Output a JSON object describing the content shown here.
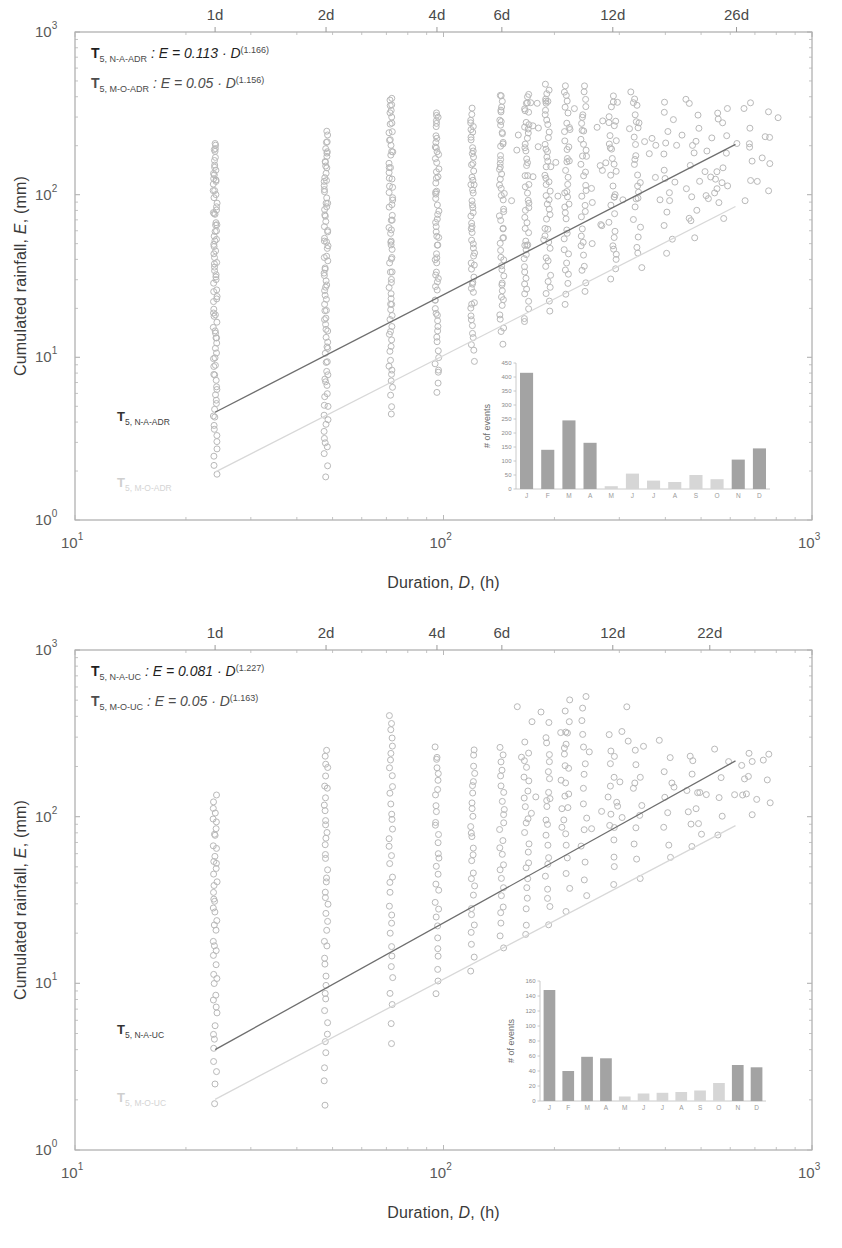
{
  "figure": {
    "panels": [
      "top",
      "bottom"
    ]
  },
  "chart_data": [
    {
      "id": "panel-top",
      "type": "scatter",
      "title": "",
      "xlabel": "Duration, D, (h)",
      "ylabel": "Cumulated rainfall, E, (mm)",
      "xscale": "log",
      "yscale": "log",
      "xlim": [
        10,
        1000
      ],
      "ylim": [
        1,
        1000
      ],
      "grid": false,
      "x_tick_labels": [
        "10",
        "10",
        "10"
      ],
      "x_tick_exponents": [
        "1",
        "2",
        "3"
      ],
      "y_tick_labels": [
        "10",
        "10",
        "10",
        "10"
      ],
      "y_tick_exponents": [
        "0",
        "1",
        "2",
        "3"
      ],
      "top_axis_label": "days",
      "top_ticks": [
        {
          "label": "1d",
          "hours": 24
        },
        {
          "label": "2d",
          "hours": 48
        },
        {
          "label": "4d",
          "hours": 96
        },
        {
          "label": "6d",
          "hours": 144
        },
        {
          "label": "12d",
          "hours": 288
        },
        {
          "label": "26d",
          "hours": 624
        }
      ],
      "annotations": [
        {
          "name": "equation-upper",
          "prefix": "T",
          "subscript": "5, N-A-ADR",
          "body": " : E = 0.113 · D",
          "exponent": "(1.166)"
        },
        {
          "name": "equation-lower",
          "prefix": "T",
          "subscript": "5, M-O-ADR",
          "body": " : E = 0.05 · D",
          "exponent": "(1.156)"
        }
      ],
      "series": [
        {
          "name": "threshold-upper",
          "type": "power-law",
          "label_prefix": "T",
          "label_subscript": "5, N-A-ADR",
          "coefficient": 0.113,
          "exponent": 1.166,
          "color": "#6e6e6e"
        },
        {
          "name": "threshold-lower",
          "type": "power-law",
          "label_prefix": "T",
          "label_subscript": "5, M-O-ADR",
          "coefficient": 0.05,
          "exponent": 1.156,
          "color": "#d8d8d8"
        }
      ],
      "points_note": "Rainfall events plotted as open circles; dense vertical columns at 24 h, 48 h, 72 h, 96 h, 120 h, 144 h multiples.",
      "inset": {
        "type": "bar",
        "ylabel": "# of events",
        "categories": [
          "J",
          "F",
          "M",
          "A",
          "M",
          "J",
          "J",
          "A",
          "S",
          "O",
          "N",
          "D"
        ],
        "values": [
          415,
          140,
          245,
          165,
          10,
          55,
          30,
          25,
          50,
          35,
          105,
          145
        ],
        "ylim": [
          0,
          450
        ],
        "y_ticks": [
          0,
          50,
          100,
          150,
          200,
          250,
          300,
          350,
          400,
          450
        ],
        "bar_colors": [
          "dark",
          "dark",
          "dark",
          "dark",
          "light",
          "light",
          "light",
          "light",
          "light",
          "light",
          "dark",
          "dark"
        ]
      }
    },
    {
      "id": "panel-bottom",
      "type": "scatter",
      "title": "",
      "xlabel": "Duration, D, (h)",
      "ylabel": "Cumulated rainfall, E, (mm)",
      "xscale": "log",
      "yscale": "log",
      "xlim": [
        10,
        1000
      ],
      "ylim": [
        1,
        1000
      ],
      "grid": false,
      "x_tick_labels": [
        "10",
        "10",
        "10"
      ],
      "x_tick_exponents": [
        "1",
        "2",
        "3"
      ],
      "y_tick_labels": [
        "10",
        "10",
        "10",
        "10"
      ],
      "y_tick_exponents": [
        "0",
        "1",
        "2",
        "3"
      ],
      "top_axis_label": "days",
      "top_ticks": [
        {
          "label": "1d",
          "hours": 24
        },
        {
          "label": "2d",
          "hours": 48
        },
        {
          "label": "4d",
          "hours": 96
        },
        {
          "label": "6d",
          "hours": 144
        },
        {
          "label": "12d",
          "hours": 288
        },
        {
          "label": "22d",
          "hours": 528
        }
      ],
      "annotations": [
        {
          "name": "equation-upper",
          "prefix": "T",
          "subscript": "5, N-A-UC",
          "body": " : E = 0.081 · D",
          "exponent": "(1.227)"
        },
        {
          "name": "equation-lower",
          "prefix": "T",
          "subscript": "5, M-O-UC",
          "body": " : E = 0.05 · D",
          "exponent": "(1.163)"
        }
      ],
      "series": [
        {
          "name": "threshold-upper",
          "type": "power-law",
          "label_prefix": "T",
          "label_subscript": "5, N-A-UC",
          "coefficient": 0.081,
          "exponent": 1.227,
          "color": "#6e6e6e"
        },
        {
          "name": "threshold-lower",
          "type": "power-law",
          "label_prefix": "T",
          "label_subscript": "5, M-O-UC",
          "coefficient": 0.05,
          "exponent": 1.163,
          "color": "#d8d8d8"
        }
      ],
      "points_note": "Rainfall events plotted as open circles; dense vertical columns at 24 h, 48 h, 72 h, 96 h, 120 h.",
      "inset": {
        "type": "bar",
        "ylabel": "# of events",
        "categories": [
          "J",
          "F",
          "M",
          "A",
          "M",
          "J",
          "J",
          "A",
          "S",
          "O",
          "N",
          "D"
        ],
        "values": [
          148,
          40,
          59,
          57,
          6,
          10,
          11,
          12,
          14,
          24,
          48,
          45
        ],
        "ylim": [
          0,
          160
        ],
        "y_ticks": [
          0,
          20,
          40,
          60,
          80,
          100,
          120,
          140,
          160
        ],
        "bar_colors": [
          "dark",
          "dark",
          "dark",
          "dark",
          "light",
          "light",
          "light",
          "light",
          "light",
          "light",
          "dark",
          "dark"
        ]
      }
    }
  ]
}
